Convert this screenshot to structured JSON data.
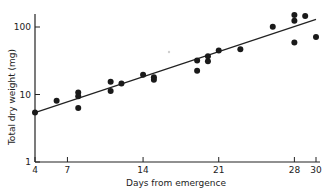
{
  "chart_data": {
    "type": "scatter",
    "title": "",
    "xlabel": "Days from emergence",
    "ylabel": "Total dry weight (mg)",
    "x_ticks": [
      4,
      7,
      14,
      21,
      28,
      30
    ],
    "y_ticks": [
      1,
      10,
      100
    ],
    "y_scale": "log",
    "xlim": [
      4,
      30
    ],
    "ylim": [
      1,
      200
    ],
    "grid": false,
    "legend": null,
    "series": [
      {
        "name": "observations",
        "points": [
          [
            4,
            5.4
          ],
          [
            6,
            8.1
          ],
          [
            8,
            10.7
          ],
          [
            8,
            9.4
          ],
          [
            8,
            6.3
          ],
          [
            11,
            15.5
          ],
          [
            11,
            11.3
          ],
          [
            12,
            14.5
          ],
          [
            14,
            19.6
          ],
          [
            15,
            18
          ],
          [
            15,
            16.5
          ],
          [
            19,
            32
          ],
          [
            19,
            22.4
          ],
          [
            20,
            37
          ],
          [
            20,
            31
          ],
          [
            21,
            45
          ],
          [
            23,
            47
          ],
          [
            26,
            101
          ],
          [
            28,
            150
          ],
          [
            28,
            124
          ],
          [
            28,
            59
          ],
          [
            29,
            145
          ],
          [
            30,
            71
          ]
        ]
      },
      {
        "name": "regression line",
        "type": "line",
        "points": [
          [
            4,
            5.4
          ],
          [
            30,
            130
          ]
        ]
      }
    ]
  }
}
